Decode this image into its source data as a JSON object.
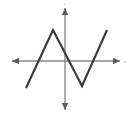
{
  "figure": {
    "background_color": "#fefefe",
    "curve_color": "#3a3a3a",
    "axis_color": "#8a8a8a",
    "arrow_color": "#5a5a5a",
    "label_color": "#b8b8b8"
  },
  "axes": {
    "x_axis": {
      "label": "x",
      "orientation": "horizontal",
      "pixel_y": 61,
      "start_px": 12,
      "end_px": 120,
      "left_arrow": true,
      "right_arrow": true
    },
    "y_axis": {
      "label": "y",
      "orientation": "vertical",
      "pixel_x": 65,
      "start_px": 8,
      "end_px": 110,
      "top_arrow": true,
      "bottom_arrow": true
    },
    "origin": {
      "x": 65,
      "y": 61
    }
  },
  "chart_data": {
    "type": "line",
    "title": "",
    "xlabel": "x",
    "ylabel": "y",
    "grid": false,
    "legend": null,
    "series": [
      {
        "name": "piecewise-linear",
        "points_px": [
          [
            26,
            88
          ],
          [
            53,
            30
          ],
          [
            82,
            86
          ],
          [
            107,
            30
          ]
        ],
        "x": [
          -2.6,
          -0.6,
          0.85,
          2.1
        ],
        "values": [
          -1.35,
          1.55,
          -1.25,
          1.55
        ],
        "shape": "down-up-down-up zigzag (M then V)",
        "vertices": [
          {
            "kind": "endpoint",
            "position": "lower-left",
            "px": [
              26,
              88
            ]
          },
          {
            "kind": "local-maximum",
            "position": "peak-left-of-y-axis",
            "px": [
              53,
              30
            ]
          },
          {
            "kind": "local-minimum",
            "position": "valley-right-of-y-axis",
            "px": [
              82,
              86
            ]
          },
          {
            "kind": "endpoint",
            "position": "upper-right",
            "px": [
              107,
              30
            ]
          }
        ]
      }
    ],
    "xlim": [
      -3.2,
      2.8
    ],
    "ylim": [
      -2.6,
      2.7
    ]
  }
}
